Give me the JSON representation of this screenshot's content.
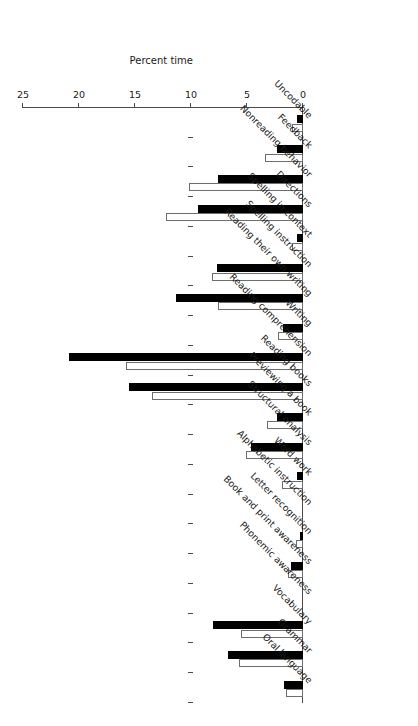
{
  "chart_data": {
    "type": "bar",
    "title": "",
    "xlabel": "",
    "ylabel": "Percent time",
    "orientation": "horizontal",
    "rotated_180": true,
    "grid": false,
    "legend_position": "none",
    "ylim": [
      0,
      25
    ],
    "axis_ticks": [
      0,
      5,
      10,
      15,
      20,
      25
    ],
    "tick_labels": [
      "0",
      "5",
      "10",
      "15",
      "20",
      "25"
    ],
    "categories": [
      "Oral language",
      "Grammar",
      "Vocabulary",
      "Phonemic awareness",
      "Book and print awareness",
      "Letter recognition",
      "Alphabetic instruction",
      "Word work",
      "Structural analysis",
      "Previewing a book",
      "Reading books",
      "Reading comprehension",
      "Writing",
      "Reading their own writing",
      "Spelling instruction",
      "Spelling in context",
      "Directions",
      "Nonreading behavior",
      "Feedback",
      "Uncodable"
    ],
    "series": [
      {
        "name": "black",
        "fill": "#000000",
        "values": [
          1.7,
          6.7,
          8.0,
          0.0,
          1.1,
          0.3,
          0.0,
          0.5,
          4.6,
          2.3,
          15.5,
          20.9,
          1.8,
          11.3,
          7.7,
          0.5,
          9.4,
          7.6,
          2.3,
          0.5
        ]
      },
      {
        "name": "white",
        "fill": "#ffffff",
        "values": [
          1.5,
          5.7,
          5.5,
          0.0,
          1.3,
          0.6,
          0.0,
          1.9,
          5.1,
          3.2,
          13.5,
          15.8,
          2.2,
          7.6,
          8.1,
          1.0,
          12.2,
          10.2,
          3.4,
          1.0
        ]
      }
    ]
  }
}
